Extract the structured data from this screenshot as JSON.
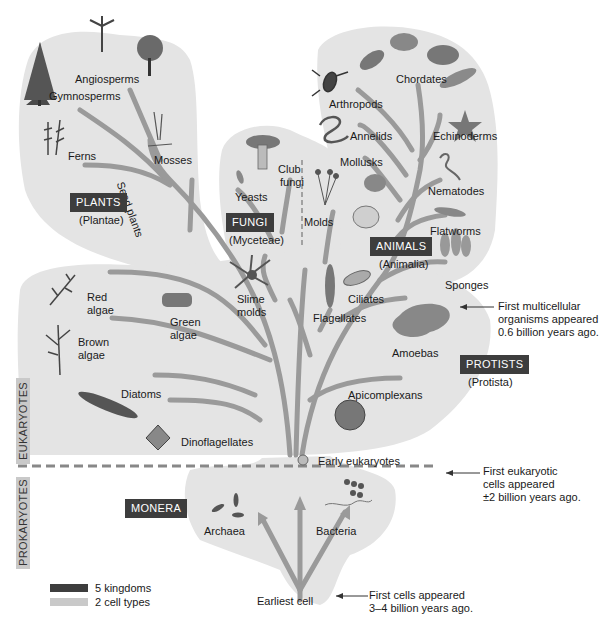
{
  "colors": {
    "background_blob": "#e4e4e4",
    "branch": "#9a9a9a",
    "kingdom_box": "#3d3d3d",
    "kingdom_text": "#ffffff",
    "cell_type_label": "#c9c9c9"
  },
  "kingdoms": [
    {
      "name": "PLANTS",
      "latin": "(Plantae)"
    },
    {
      "name": "FUNGI",
      "latin": "(Myceteae)"
    },
    {
      "name": "ANIMALS",
      "latin": "(Animalia)"
    },
    {
      "name": "PROTISTS",
      "latin": "(Protista)"
    },
    {
      "name": "MONERA",
      "latin": ""
    }
  ],
  "plants": {
    "groups": [
      "Angiosperms",
      "Gymnosperms",
      "Ferns",
      "Mosses"
    ],
    "branch_label": "Seed plants"
  },
  "fungi": {
    "groups": [
      "Yeasts",
      "Club fungi",
      "Molds"
    ],
    "club_line1": "Club",
    "club_line2": "fungi"
  },
  "animals": {
    "groups": [
      "Chordates",
      "Arthropods",
      "Annelids",
      "Echinoderms",
      "Mollusks",
      "Nematodes",
      "Flatworms",
      "Sponges"
    ]
  },
  "protists": {
    "groups": [
      {
        "line1": "Red",
        "line2": "algae"
      },
      {
        "line1": "Green",
        "line2": "algae"
      },
      {
        "line1": "Slime",
        "line2": "molds"
      },
      {
        "line1": "Brown",
        "line2": "algae"
      },
      {
        "line1": "Diatoms",
        "line2": ""
      },
      {
        "line1": "Dinoflagellates",
        "line2": ""
      },
      {
        "line1": "Flagellates",
        "line2": ""
      },
      {
        "line1": "Ciliates",
        "line2": ""
      },
      {
        "line1": "Amoebas",
        "line2": ""
      },
      {
        "line1": "Apicomplexans",
        "line2": ""
      }
    ]
  },
  "early_eukaryotes": "Early eukaryotes",
  "monera": {
    "groups": [
      "Archaea",
      "Bacteria"
    ],
    "root": "Earliest cell"
  },
  "cell_types": {
    "upper": "EUKARYOTES",
    "lower": "PROKARYOTES"
  },
  "timeline_notes": [
    {
      "line1": "First multicellular",
      "line2": "organisms appeared",
      "line3": "0.6 billion years ago."
    },
    {
      "line1": "First eukaryotic",
      "line2": "cells appeared",
      "line3": "±2 billion years ago."
    },
    {
      "line1": "First  cells appeared",
      "line2": "3–4 billion years ago.",
      "line3": ""
    }
  ],
  "legend": [
    {
      "label": "5 kingdoms",
      "color": "#3d3d3d"
    },
    {
      "label": "2 cell types",
      "color": "#c9c9c9"
    }
  ]
}
